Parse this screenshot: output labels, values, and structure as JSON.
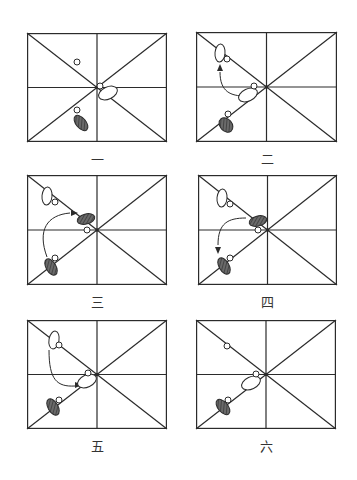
{
  "diagram": {
    "title": "",
    "colors": {
      "line": "#2b2b2b",
      "dark_foot": "#555555",
      "white_foot": "#ffffff",
      "marker": "#ffffff",
      "background": "#ffffff"
    },
    "panels": [
      {
        "id": "1",
        "label": "一",
        "box": {
          "x": 27,
          "y": 33,
          "w": 140,
          "h": 109
        },
        "label_pos": {
          "x": 77,
          "y": 153
        },
        "markers": [
          [
            50,
            29
          ],
          [
            73,
            53
          ],
          [
            50,
            77
          ]
        ],
        "white_feet": [
          {
            "cx": 81,
            "cy": 60,
            "rx": 10,
            "ry": 6,
            "rot": -25
          }
        ],
        "dark_feet": [
          {
            "cx": 54,
            "cy": 90,
            "rx": 5,
            "ry": 9,
            "rot": -40
          }
        ],
        "arrows": []
      },
      {
        "id": "2",
        "label": "二",
        "box": {
          "x": 196,
          "y": 32,
          "w": 141,
          "h": 110
        },
        "label_pos": {
          "x": 247,
          "y": 153
        },
        "markers": [
          [
            31,
            27
          ],
          [
            58,
            54
          ],
          [
            32,
            82
          ]
        ],
        "white_feet": [
          {
            "cx": 24,
            "cy": 21,
            "rx": 5,
            "ry": 9,
            "rot": 5
          },
          {
            "cx": 52,
            "cy": 63,
            "rx": 10,
            "ry": 6,
            "rot": -25
          }
        ],
        "dark_feet": [
          {
            "cx": 30,
            "cy": 93,
            "rx": 6,
            "ry": 8,
            "rot": -40
          }
        ],
        "arrows": [
          {
            "path": "M 49 64 C 35 64 24 60 24 40",
            "head": [
              24,
              36
            ],
            "dir": "up"
          }
        ]
      },
      {
        "id": "3",
        "label": "三",
        "box": {
          "x": 27,
          "y": 175,
          "w": 140,
          "h": 110
        },
        "label_pos": {
          "x": 77,
          "y": 296
        },
        "markers": [
          [
            28,
            27
          ],
          [
            60,
            55
          ],
          [
            28,
            83
          ]
        ],
        "white_feet": [
          {
            "cx": 20,
            "cy": 21,
            "rx": 5,
            "ry": 9,
            "rot": 5
          }
        ],
        "dark_feet": [
          {
            "cx": 59,
            "cy": 44,
            "rx": 9,
            "ry": 5,
            "rot": -15
          },
          {
            "cx": 24,
            "cy": 92,
            "rx": 5,
            "ry": 9,
            "rot": -30
          }
        ],
        "arrows": [
          {
            "path": "M 20 82 C 10 55 20 40 43 38",
            "head": [
              48,
              38
            ],
            "dir": "right"
          }
        ]
      },
      {
        "id": "4",
        "label": "四",
        "box": {
          "x": 198,
          "y": 175,
          "w": 139,
          "h": 110
        },
        "label_pos": {
          "x": 247,
          "y": 296
        },
        "markers": [
          [
            32,
            29
          ],
          [
            60,
            55
          ],
          [
            32,
            83
          ]
        ],
        "white_feet": [
          {
            "cx": 24,
            "cy": 23,
            "rx": 5,
            "ry": 9,
            "rot": 5
          }
        ],
        "dark_feet": [
          {
            "cx": 60,
            "cy": 46,
            "rx": 9,
            "ry": 5,
            "rot": -15
          },
          {
            "cx": 26,
            "cy": 91,
            "rx": 5,
            "ry": 9,
            "rot": -30
          }
        ],
        "arrows": [
          {
            "path": "M 48 43 C 30 43 20 48 20 70",
            "head": [
              20,
              75
            ],
            "dir": "down"
          }
        ]
      },
      {
        "id": "5",
        "label": "五",
        "box": {
          "x": 27,
          "y": 320,
          "w": 140,
          "h": 109
        },
        "label_pos": {
          "x": 77,
          "y": 440
        },
        "markers": [
          [
            32,
            25
          ],
          [
            61,
            53
          ],
          [
            32,
            80
          ]
        ],
        "white_feet": [
          {
            "cx": 27,
            "cy": 20,
            "rx": 5,
            "ry": 9,
            "rot": 10
          },
          {
            "cx": 60,
            "cy": 61,
            "rx": 10,
            "ry": 6,
            "rot": -25
          }
        ],
        "dark_feet": [
          {
            "cx": 26,
            "cy": 87,
            "rx": 5,
            "ry": 9,
            "rot": -30
          }
        ],
        "arrows": [
          {
            "path": "M 22 30 C 22 60 30 67 48 66",
            "head": [
              52,
              65
            ],
            "dir": "right"
          }
        ]
      },
      {
        "id": "6",
        "label": "六",
        "box": {
          "x": 196,
          "y": 320,
          "w": 140,
          "h": 109
        },
        "label_pos": {
          "x": 246,
          "y": 440
        },
        "markers": [
          [
            31,
            26
          ],
          [
            60,
            54
          ],
          [
            32,
            80
          ]
        ],
        "white_feet": [
          {
            "cx": 55,
            "cy": 63,
            "rx": 10,
            "ry": 6,
            "rot": -25
          }
        ],
        "dark_feet": [
          {
            "cx": 27,
            "cy": 87,
            "rx": 5,
            "ry": 9,
            "rot": -40
          }
        ],
        "arrows": []
      }
    ]
  }
}
